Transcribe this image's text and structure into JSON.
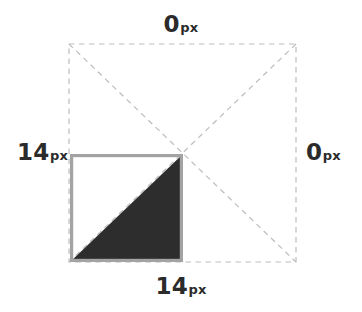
{
  "diagram": {
    "type": "geometry-diagram",
    "canvas": {
      "width": 362,
      "height": 312,
      "background": "#ffffff"
    },
    "labels": {
      "top": {
        "value": "0",
        "unit": "px",
        "position": "top",
        "full": "0px"
      },
      "right": {
        "value": "0",
        "unit": "px",
        "position": "right",
        "full": "0px"
      },
      "bottom": {
        "value": "14",
        "unit": "px",
        "position": "bottom",
        "full": "14px"
      },
      "left": {
        "value": "14",
        "unit": "px",
        "position": "left",
        "full": "14px"
      }
    },
    "shapes": {
      "outer_square": {
        "name": "dashed-bounding-square",
        "x": 69,
        "y": 44,
        "width": 227,
        "height": 218,
        "stroke": "#bdbdbd",
        "stroke_style": "dashed",
        "stroke_width": 1.2,
        "fill": "none"
      },
      "diagonals": {
        "name": "dashed-diagonals",
        "stroke": "#bdbdbd",
        "stroke_style": "dashed",
        "stroke_width": 1.2,
        "center_x": 182.5,
        "center_y": 153
      },
      "inner_square": {
        "name": "gray-outlined-square",
        "x": 70,
        "y": 154,
        "width": 113,
        "height": 108,
        "stroke": "#a3a3a3",
        "stroke_width": 3.2,
        "fill": "#ffffff"
      },
      "filled_triangle": {
        "name": "dark-filled-triangle",
        "points": "71.5,260.5 181.5,260.5 181.5,155.5",
        "fill": "#2d2d2d",
        "description": "lower-right half of inner square"
      }
    },
    "colors": {
      "text": "#2b2b2b",
      "dashed_stroke": "#bdbdbd",
      "solid_stroke": "#a3a3a3",
      "triangle_fill": "#2d2d2d",
      "background": "#ffffff"
    }
  }
}
